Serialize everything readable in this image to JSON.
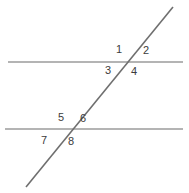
{
  "figure": {
    "canvas": {
      "width": 189,
      "height": 193,
      "background": "#ffffff"
    },
    "line_color": "#9b9b9b",
    "transversal_color": "#6f6f6f",
    "label_color": "#3c3c3c",
    "label_font_size": 11,
    "lines": [
      {
        "name": "upper-parallel-line",
        "x1": 8,
        "y1": 62,
        "x2": 183,
        "y2": 62,
        "color": "#9b9b9b",
        "stroke_width": 1.6
      },
      {
        "name": "lower-parallel-line",
        "x1": 5,
        "y1": 129,
        "x2": 183,
        "y2": 129,
        "color": "#9b9b9b",
        "stroke_width": 1.6
      },
      {
        "name": "transversal-line",
        "x1": 26,
        "y1": 187,
        "x2": 173,
        "y2": 7,
        "color": "#6f6f6f",
        "stroke_width": 1.6
      }
    ],
    "intersections": [
      {
        "name": "upper-intersection",
        "x": 128,
        "y": 62
      },
      {
        "name": "lower-intersection",
        "x": 73,
        "y": 129
      }
    ],
    "angle_labels": [
      {
        "text": "1",
        "x": 119,
        "y": 49,
        "position": "above-upper-line-left-of-transversal"
      },
      {
        "text": "2",
        "x": 146,
        "y": 50,
        "position": "above-upper-line-right-of-transversal"
      },
      {
        "text": "3",
        "x": 108,
        "y": 70,
        "position": "below-upper-line-left-of-transversal"
      },
      {
        "text": "4",
        "x": 134,
        "y": 71,
        "position": "below-upper-line-right-of-transversal"
      },
      {
        "text": "5",
        "x": 61,
        "y": 117,
        "position": "above-lower-line-left-of-transversal"
      },
      {
        "text": "6",
        "x": 83,
        "y": 118,
        "position": "above-lower-line-right-of-transversal"
      },
      {
        "text": "7",
        "x": 44,
        "y": 140,
        "position": "below-lower-line-left-of-transversal"
      },
      {
        "text": "8",
        "x": 71,
        "y": 141,
        "position": "below-lower-line-right-of-transversal"
      }
    ]
  }
}
